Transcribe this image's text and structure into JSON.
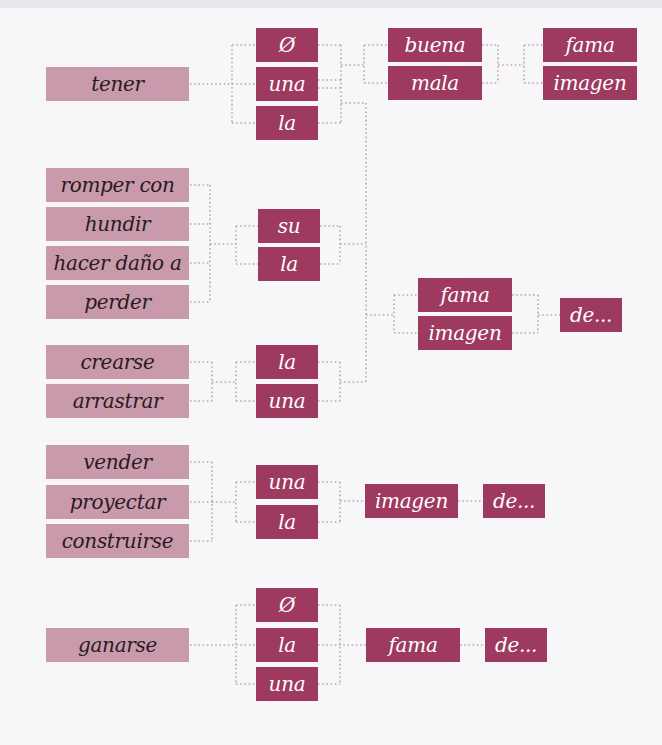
{
  "colors": {
    "verb_box": "#c99aab",
    "term_box": "#9e3a5f",
    "connector": "#c4a3b1",
    "background": "#f7f7f9"
  },
  "groups": [
    {
      "verbs": [
        "tener"
      ],
      "articles": [
        "Ø",
        "una",
        "la"
      ],
      "adjectives": [
        "buena",
        "mala"
      ],
      "nouns": [
        "fama",
        "imagen"
      ]
    },
    {
      "verbs": [
        "romper con",
        "hundir",
        "hacer daño a",
        "perder"
      ],
      "articles": [
        "su",
        "la"
      ]
    },
    {
      "shared_nouns": [
        "fama",
        "imagen"
      ],
      "complement": "de..."
    },
    {
      "verbs": [
        "crearse",
        "arrastrar"
      ],
      "articles": [
        "la",
        "una"
      ]
    },
    {
      "verbs": [
        "vender",
        "proyectar",
        "construirse"
      ],
      "articles": [
        "una",
        "la"
      ],
      "noun": "imagen",
      "complement": "de..."
    },
    {
      "verbs": [
        "ganarse"
      ],
      "articles": [
        "Ø",
        "la",
        "una"
      ],
      "noun": "fama",
      "complement": "de..."
    }
  ]
}
